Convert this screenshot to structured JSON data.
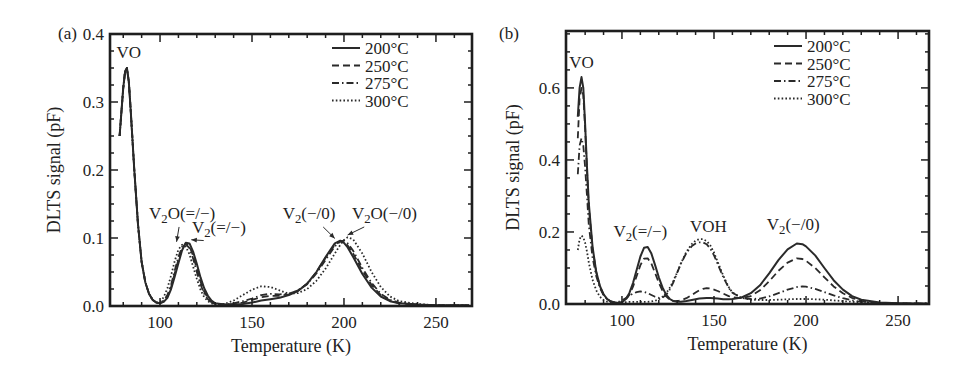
{
  "figure": {
    "panels": [
      {
        "id": "a",
        "label": "(a)"
      },
      {
        "id": "b",
        "label": "(b)"
      }
    ]
  },
  "chart_data": [
    {
      "type": "line",
      "panel_label": "(a)",
      "title": "",
      "xlabel": "Temperature (K)",
      "ylabel": "DLTS signal (pF)",
      "xlim": [
        72.8,
        269.6
      ],
      "ylim": [
        0.0,
        0.4
      ],
      "xticks": [
        100,
        150,
        200,
        250
      ],
      "yticks": [
        0.0,
        0.1,
        0.2,
        0.3,
        0.4
      ],
      "ytick_labels": [
        "0.0",
        "0.1",
        "0.2",
        "0.3",
        "0.4"
      ],
      "grid": false,
      "legend_position": "upper right",
      "legend": [
        "200°C",
        "250°C",
        "275°C",
        "300°C"
      ],
      "annotations": [
        {
          "text": "VO",
          "x": 83,
          "y": 0.365
        },
        {
          "text": "V2O(=/−)",
          "x": 112,
          "y": 0.128,
          "arrow_to": [
            109,
            0.09
          ]
        },
        {
          "text": "V2(=/−)",
          "x": 132,
          "y": 0.108,
          "arrow_to": [
            117,
            0.093
          ]
        },
        {
          "text": "V2(−/0)",
          "x": 181,
          "y": 0.128,
          "arrow_to": [
            195,
            0.095
          ]
        },
        {
          "text": "V2O(−/0)",
          "x": 222,
          "y": 0.128,
          "arrow_to": [
            202,
            0.1
          ]
        }
      ],
      "x": [
        78,
        80,
        81,
        82,
        83,
        84,
        86,
        88,
        90,
        92,
        94,
        96,
        98,
        100,
        102,
        104,
        106,
        108,
        110,
        112,
        114,
        116,
        118,
        120,
        122,
        124,
        126,
        128,
        130,
        135,
        140,
        145,
        150,
        155,
        160,
        165,
        170,
        175,
        180,
        185,
        190,
        195,
        198,
        200,
        202,
        205,
        210,
        215,
        220,
        225,
        230,
        240,
        250,
        260,
        268
      ],
      "series": [
        {
          "name": "200°C",
          "dash": "solid",
          "values": [
            0.25,
            0.32,
            0.345,
            0.35,
            0.33,
            0.29,
            0.2,
            0.12,
            0.065,
            0.035,
            0.018,
            0.009,
            0.005,
            0.004,
            0.006,
            0.012,
            0.025,
            0.043,
            0.063,
            0.082,
            0.093,
            0.092,
            0.08,
            0.062,
            0.042,
            0.026,
            0.015,
            0.008,
            0.004,
            0.002,
            0.002,
            0.003,
            0.005,
            0.008,
            0.01,
            0.012,
            0.016,
            0.022,
            0.033,
            0.05,
            0.072,
            0.092,
            0.096,
            0.093,
            0.086,
            0.072,
            0.047,
            0.027,
            0.014,
            0.007,
            0.004,
            0.002,
            0.001,
            0.001,
            0.001
          ]
        },
        {
          "name": "250°C",
          "dash": "dashed",
          "values": [
            0.25,
            0.32,
            0.345,
            0.35,
            0.33,
            0.29,
            0.2,
            0.12,
            0.065,
            0.035,
            0.018,
            0.009,
            0.005,
            0.004,
            0.007,
            0.014,
            0.028,
            0.048,
            0.068,
            0.085,
            0.092,
            0.088,
            0.074,
            0.055,
            0.036,
            0.021,
            0.012,
            0.006,
            0.003,
            0.002,
            0.003,
            0.005,
            0.009,
            0.013,
            0.015,
            0.015,
            0.017,
            0.023,
            0.033,
            0.05,
            0.071,
            0.09,
            0.095,
            0.094,
            0.089,
            0.077,
            0.052,
            0.031,
            0.016,
            0.008,
            0.004,
            0.002,
            0.001,
            0.001,
            0.001
          ]
        },
        {
          "name": "275°C",
          "dash": "dashdot",
          "values": [
            0.25,
            0.32,
            0.345,
            0.35,
            0.33,
            0.29,
            0.2,
            0.12,
            0.065,
            0.035,
            0.018,
            0.009,
            0.005,
            0.004,
            0.008,
            0.016,
            0.031,
            0.052,
            0.072,
            0.087,
            0.091,
            0.085,
            0.07,
            0.05,
            0.032,
            0.018,
            0.01,
            0.005,
            0.003,
            0.002,
            0.004,
            0.007,
            0.011,
            0.016,
            0.018,
            0.017,
            0.018,
            0.023,
            0.032,
            0.048,
            0.068,
            0.088,
            0.095,
            0.096,
            0.092,
            0.081,
            0.056,
            0.034,
            0.018,
            0.009,
            0.005,
            0.002,
            0.001,
            0.001,
            0.001
          ]
        },
        {
          "name": "300°C",
          "dash": "dotted",
          "values": [
            0.25,
            0.32,
            0.345,
            0.35,
            0.33,
            0.29,
            0.2,
            0.12,
            0.065,
            0.035,
            0.018,
            0.009,
            0.005,
            0.006,
            0.013,
            0.026,
            0.045,
            0.066,
            0.083,
            0.09,
            0.087,
            0.076,
            0.058,
            0.04,
            0.024,
            0.013,
            0.007,
            0.004,
            0.002,
            0.003,
            0.008,
            0.016,
            0.024,
            0.029,
            0.028,
            0.023,
            0.018,
            0.019,
            0.025,
            0.037,
            0.055,
            0.077,
            0.09,
            0.097,
            0.101,
            0.098,
            0.077,
            0.05,
            0.028,
            0.014,
            0.007,
            0.003,
            0.001,
            0.001,
            0.001
          ]
        }
      ]
    },
    {
      "type": "line",
      "panel_label": "(b)",
      "title": "",
      "xlabel": "Temperature (K)",
      "ylabel": "DLTS signal (pF)",
      "xlim": [
        69.6,
        266.8
      ],
      "ylim": [
        0.0,
        0.758
      ],
      "xticks": [
        100,
        150,
        200,
        250
      ],
      "yticks": [
        0.0,
        0.2,
        0.4,
        0.6
      ],
      "ytick_labels": [
        "0.0",
        "0.2",
        "0.4",
        "0.6"
      ],
      "grid": false,
      "legend_position": "upper right",
      "legend": [
        "200°C",
        "250°C",
        "275°C",
        "300°C"
      ],
      "annotations": [
        {
          "text": "VO",
          "x": 78,
          "y": 0.655
        },
        {
          "text": "V2(=/−)",
          "x": 110,
          "y": 0.185
        },
        {
          "text": "VOH",
          "x": 147,
          "y": 0.2
        },
        {
          "text": "V2(−/0)",
          "x": 193,
          "y": 0.205
        }
      ],
      "x": [
        76,
        77,
        78,
        79,
        80,
        81,
        82,
        84,
        86,
        88,
        90,
        92,
        94,
        96,
        98,
        100,
        102,
        104,
        106,
        108,
        110,
        112,
        114,
        116,
        118,
        120,
        122,
        124,
        126,
        128,
        130,
        132,
        135,
        138,
        140,
        142,
        144,
        146,
        148,
        150,
        152,
        155,
        158,
        160,
        165,
        170,
        175,
        180,
        185,
        190,
        195,
        198,
        200,
        205,
        210,
        215,
        220,
        225,
        230,
        240,
        250,
        260,
        266
      ],
      "series": [
        {
          "name": "200°C",
          "dash": "solid",
          "values": [
            0.52,
            0.6,
            0.63,
            0.6,
            0.5,
            0.38,
            0.28,
            0.16,
            0.09,
            0.05,
            0.027,
            0.014,
            0.007,
            0.004,
            0.003,
            0.005,
            0.013,
            0.03,
            0.058,
            0.095,
            0.132,
            0.156,
            0.158,
            0.14,
            0.108,
            0.074,
            0.046,
            0.026,
            0.014,
            0.008,
            0.006,
            0.006,
            0.008,
            0.011,
            0.013,
            0.015,
            0.016,
            0.017,
            0.017,
            0.016,
            0.015,
            0.013,
            0.013,
            0.014,
            0.018,
            0.03,
            0.052,
            0.085,
            0.122,
            0.152,
            0.168,
            0.166,
            0.16,
            0.135,
            0.1,
            0.066,
            0.04,
            0.022,
            0.012,
            0.004,
            0.002,
            0.001,
            0.001
          ]
        },
        {
          "name": "250°C",
          "dash": "dashed",
          "values": [
            0.46,
            0.57,
            0.6,
            0.58,
            0.49,
            0.37,
            0.27,
            0.155,
            0.088,
            0.049,
            0.026,
            0.013,
            0.007,
            0.004,
            0.003,
            0.005,
            0.011,
            0.025,
            0.048,
            0.078,
            0.108,
            0.126,
            0.127,
            0.112,
            0.086,
            0.059,
            0.037,
            0.021,
            0.012,
            0.008,
            0.008,
            0.01,
            0.016,
            0.025,
            0.032,
            0.038,
            0.042,
            0.044,
            0.043,
            0.04,
            0.036,
            0.029,
            0.022,
            0.019,
            0.016,
            0.022,
            0.038,
            0.063,
            0.092,
            0.115,
            0.127,
            0.125,
            0.12,
            0.1,
            0.074,
            0.049,
            0.03,
            0.017,
            0.009,
            0.003,
            0.002,
            0.001,
            0.001
          ]
        },
        {
          "name": "275°C",
          "dash": "dashdot",
          "values": [
            0.36,
            0.44,
            0.46,
            0.44,
            0.38,
            0.3,
            0.22,
            0.13,
            0.078,
            0.045,
            0.024,
            0.013,
            0.007,
            0.005,
            0.006,
            0.01,
            0.016,
            0.023,
            0.029,
            0.033,
            0.035,
            0.034,
            0.03,
            0.025,
            0.02,
            0.017,
            0.018,
            0.025,
            0.04,
            0.061,
            0.087,
            0.112,
            0.142,
            0.161,
            0.168,
            0.171,
            0.171,
            0.166,
            0.154,
            0.135,
            0.111,
            0.075,
            0.045,
            0.031,
            0.017,
            0.014,
            0.015,
            0.021,
            0.03,
            0.04,
            0.047,
            0.049,
            0.048,
            0.042,
            0.033,
            0.024,
            0.016,
            0.01,
            0.006,
            0.002,
            0.001,
            0.001,
            0.001
          ]
        },
        {
          "name": "300°C",
          "dash": "dotted",
          "values": [
            0.15,
            0.18,
            0.19,
            0.185,
            0.17,
            0.145,
            0.115,
            0.068,
            0.038,
            0.02,
            0.011,
            0.006,
            0.004,
            0.003,
            0.003,
            0.004,
            0.005,
            0.006,
            0.006,
            0.006,
            0.006,
            0.006,
            0.006,
            0.007,
            0.009,
            0.013,
            0.02,
            0.03,
            0.045,
            0.065,
            0.088,
            0.113,
            0.145,
            0.167,
            0.176,
            0.18,
            0.18,
            0.175,
            0.163,
            0.143,
            0.117,
            0.079,
            0.047,
            0.032,
            0.017,
            0.012,
            0.011,
            0.011,
            0.012,
            0.013,
            0.014,
            0.014,
            0.014,
            0.013,
            0.012,
            0.01,
            0.008,
            0.006,
            0.004,
            0.002,
            0.001,
            0.001,
            0.001
          ]
        }
      ]
    }
  ],
  "layout": {
    "panels": [
      {
        "box": [
          110,
          34,
          472,
          306
        ],
        "label_pos": [
          58,
          33
        ],
        "legend_box": [
          332,
          48
        ],
        "ylabel_x": 60
      },
      {
        "box": [
          566,
          31,
          929,
          304
        ],
        "label_pos": [
          499,
          33
        ],
        "legend_box": [
          774,
          46
        ],
        "ylabel_x": 519
      }
    ]
  }
}
